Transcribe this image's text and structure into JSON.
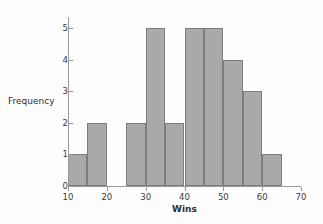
{
  "chart_data": {
    "type": "bar",
    "title": "",
    "xlabel": "Wins",
    "ylabel": "Frequency",
    "bin_width": 5,
    "bin_edges": [
      10,
      15,
      20,
      25,
      30,
      35,
      40,
      45,
      50,
      55,
      60,
      65
    ],
    "categories": [
      "10-15",
      "15-20",
      "20-25",
      "25-30",
      "30-35",
      "35-40",
      "40-45",
      "45-50",
      "50-55",
      "55-60",
      "60-65"
    ],
    "values": [
      1,
      2,
      0,
      2,
      5,
      2,
      5,
      5,
      4,
      3,
      1
    ],
    "xlim": [
      10,
      70
    ],
    "ylim": [
      0,
      5
    ],
    "x_ticks": [
      10,
      20,
      30,
      40,
      50,
      60,
      70
    ],
    "x_tick_labels": [
      "10",
      "20",
      "30",
      "40",
      "50",
      "60",
      "70"
    ],
    "y_ticks": [
      0,
      1,
      2,
      3,
      4,
      5
    ],
    "y_tick_labels": [
      "0",
      "1",
      "2",
      "3",
      "4",
      "5"
    ],
    "grid": false,
    "legend": null,
    "colors": {
      "bar_fill": "#a9a9a9",
      "bar_edge": "#7d7d7d",
      "axis": "#9a9a9a",
      "text": "#2e2e2e",
      "background": "#fdfdfd"
    }
  }
}
